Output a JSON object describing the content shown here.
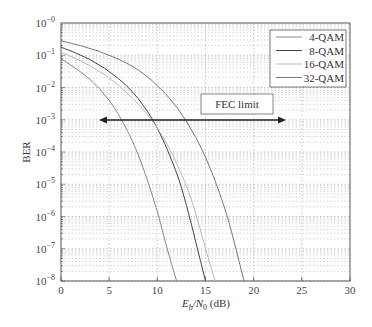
{
  "chart_data": {
    "type": "line",
    "title": "",
    "xlabel": "E_b/N_0 (dB)",
    "ylabel": "BER",
    "xlim": [
      0,
      30
    ],
    "ylim_log10": [
      -8,
      0
    ],
    "yscale": "log",
    "grid": true,
    "x_ticks": [
      "0",
      "5",
      "10",
      "15",
      "20",
      "25",
      "30"
    ],
    "y_ticks": [
      "10^-0",
      "10^-1",
      "10^-2",
      "10^-3",
      "10^-4",
      "10^-5",
      "10^-6",
      "10^-7",
      "10^-8"
    ],
    "legend_position": "upper right",
    "series": [
      {
        "name": "4-QAM",
        "color": "#888888",
        "x": [
          0,
          2,
          4,
          6,
          8,
          10,
          11,
          12
        ],
        "log10_ber": [
          -1.1,
          -1.5,
          -2.0,
          -2.8,
          -4.0,
          -5.8,
          -7.0,
          -8.0
        ]
      },
      {
        "name": "8-QAM",
        "color": "#444444",
        "x": [
          0,
          3,
          6,
          8,
          10,
          12,
          13,
          14,
          15
        ],
        "log10_ber": [
          -0.75,
          -1.1,
          -1.7,
          -2.3,
          -3.2,
          -4.6,
          -5.6,
          -6.8,
          -8.0
        ]
      },
      {
        "name": "16-QAM",
        "color": "#bbbbbb",
        "x": [
          0,
          3,
          6,
          9,
          11,
          13,
          14,
          15,
          16
        ],
        "log10_ber": [
          -0.9,
          -1.3,
          -1.9,
          -2.8,
          -3.7,
          -5.0,
          -5.9,
          -7.0,
          -8.0
        ]
      },
      {
        "name": "32-QAM",
        "color": "#777777",
        "x": [
          0,
          4,
          8,
          11,
          13,
          15,
          17,
          18,
          19
        ],
        "log10_ber": [
          -0.55,
          -0.85,
          -1.4,
          -2.2,
          -3.0,
          -4.1,
          -5.7,
          -6.8,
          -8.0
        ]
      }
    ],
    "annotations": [
      {
        "text": "FEC limit",
        "type": "double-arrow",
        "y_log10": -3,
        "x_from": 4,
        "x_to": 23.5
      }
    ]
  },
  "labels": {
    "xlabel_E": "E",
    "xlabel_b": "b",
    "xlabel_N": "/N",
    "xlabel_0": "0",
    "xlabel_unit": " (dB)",
    "ylabel": "BER",
    "fec": "FEC limit",
    "legend": [
      "4-QAM",
      "8-QAM",
      "16-QAM",
      "32-QAM"
    ]
  }
}
